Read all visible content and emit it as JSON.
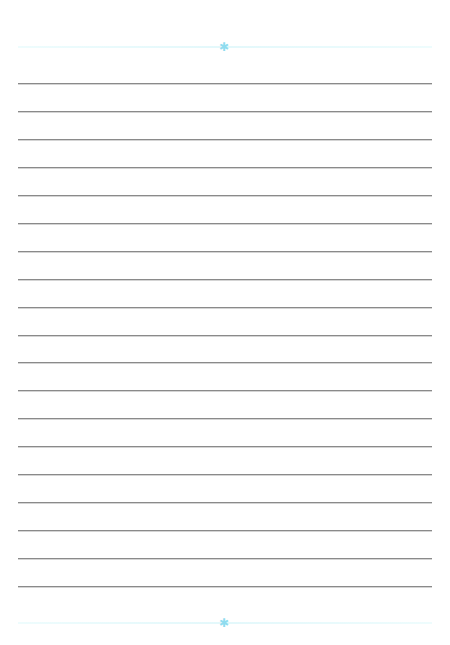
{
  "page": {
    "type": "lined-paper",
    "ruled_line_count": 19,
    "colors": {
      "background": "#ffffff",
      "rule_line": "#8a8a8a",
      "border_line": "#e3f8fb",
      "ornament": "#8fdcef"
    },
    "ornaments": {
      "top": {
        "icon": "snowflake-icon",
        "glyph": "✱"
      },
      "bottom": {
        "icon": "snowflake-icon",
        "glyph": "✱"
      }
    }
  }
}
